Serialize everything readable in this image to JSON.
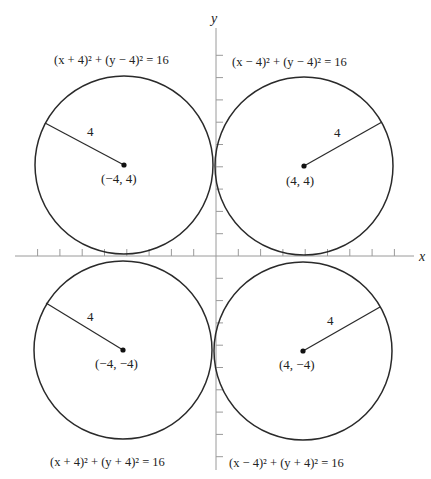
{
  "colors": {
    "ink": "#2a2a2a",
    "axis": "#9a9a9a",
    "background": "#ffffff"
  },
  "axes": {
    "x_label": "x",
    "y_label": "y",
    "origin_px": [
      216,
      256
    ],
    "unit_px": 22.3,
    "x_range": [
      -9,
      9
    ],
    "y_range": [
      -9.5,
      10
    ]
  },
  "circles": [
    {
      "id": "top-left",
      "center": [
        -4,
        4
      ],
      "radius": 4,
      "equation": "(x + 4)² + (y − 4)² = 16",
      "center_label": "(−4, 4)",
      "radius_label": "4",
      "radius_angle_deg": 152
    },
    {
      "id": "top-right",
      "center": [
        4,
        4
      ],
      "radius": 4,
      "equation": "(x − 4)² + (y − 4)² = 16",
      "center_label": "(4, 4)",
      "radius_label": "4",
      "radius_angle_deg": 29
    },
    {
      "id": "bottom-left",
      "center": [
        -4,
        -4
      ],
      "radius": 4,
      "equation": "(x + 4)² + (y + 4)² = 16",
      "center_label": "(−4, −4)",
      "radius_label": "4",
      "radius_angle_deg": 151
    },
    {
      "id": "bottom-right",
      "center": [
        4,
        -4
      ],
      "radius": 4,
      "equation": "(x − 4)² + (y + 4)² = 16",
      "center_label": "(4, −4)",
      "radius_label": "4",
      "radius_angle_deg": 27
    }
  ],
  "labels": {
    "eq_top_left": "(x + 4)² + (y − 4)² = 16",
    "eq_top_right": "(x − 4)² + (y − 4)² = 16",
    "eq_bottom_left": "(x + 4)² + (y + 4)² = 16",
    "eq_bottom_right": "(x − 4)² + (y + 4)² = 16",
    "center_top_left": "(−4, 4)",
    "center_top_right": "(4, 4)",
    "center_bottom_left": "(−4, −4)",
    "center_bottom_right": "(4, −4)",
    "radius_top_left": "4",
    "radius_top_right": "4",
    "radius_bottom_left": "4",
    "radius_bottom_right": "4"
  }
}
